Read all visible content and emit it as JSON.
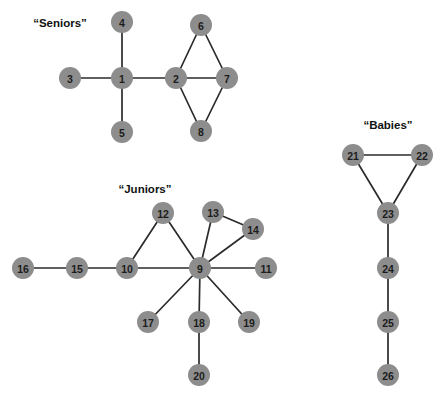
{
  "figure": {
    "background_color": "#ffffff",
    "node_color": "#8d8d8d",
    "edge_color": "#2b2b2b",
    "label_color": "#1c1c1c",
    "node_radius": 11
  },
  "cluster_labels": [
    {
      "text": "“Seniors”",
      "x": 60,
      "y": 23
    },
    {
      "text": "“Juniors”",
      "x": 145,
      "y": 189
    },
    {
      "text": "“Babies”",
      "x": 388,
      "y": 125
    }
  ],
  "nodes": [
    {
      "id": "1",
      "label": "1",
      "x": 122,
      "y": 78,
      "cluster": "Seniors"
    },
    {
      "id": "2",
      "label": "2",
      "x": 176,
      "y": 78,
      "cluster": "Seniors"
    },
    {
      "id": "3",
      "label": "3",
      "x": 70,
      "y": 78,
      "cluster": "Seniors"
    },
    {
      "id": "4",
      "label": "4",
      "x": 122,
      "y": 22,
      "cluster": "Seniors"
    },
    {
      "id": "5",
      "label": "5",
      "x": 122,
      "y": 132,
      "cluster": "Seniors"
    },
    {
      "id": "6",
      "label": "6",
      "x": 201,
      "y": 25,
      "cluster": "Seniors"
    },
    {
      "id": "7",
      "label": "7",
      "x": 227,
      "y": 78,
      "cluster": "Seniors"
    },
    {
      "id": "8",
      "label": "8",
      "x": 201,
      "y": 131,
      "cluster": "Seniors"
    },
    {
      "id": "9",
      "label": "9",
      "x": 200,
      "y": 268,
      "cluster": "Juniors"
    },
    {
      "id": "10",
      "label": "10",
      "x": 127,
      "y": 268,
      "cluster": "Juniors"
    },
    {
      "id": "11",
      "label": "11",
      "x": 266,
      "y": 268,
      "cluster": "Juniors"
    },
    {
      "id": "12",
      "label": "12",
      "x": 163,
      "y": 213,
      "cluster": "Juniors"
    },
    {
      "id": "13",
      "label": "13",
      "x": 213,
      "y": 212,
      "cluster": "Juniors"
    },
    {
      "id": "14",
      "label": "14",
      "x": 253,
      "y": 229,
      "cluster": "Juniors"
    },
    {
      "id": "15",
      "label": "15",
      "x": 77,
      "y": 268,
      "cluster": "Juniors"
    },
    {
      "id": "16",
      "label": "16",
      "x": 23,
      "y": 268,
      "cluster": "Juniors"
    },
    {
      "id": "17",
      "label": "17",
      "x": 148,
      "y": 322,
      "cluster": "Juniors"
    },
    {
      "id": "18",
      "label": "18",
      "x": 199,
      "y": 322,
      "cluster": "Juniors"
    },
    {
      "id": "19",
      "label": "19",
      "x": 249,
      "y": 322,
      "cluster": "Juniors"
    },
    {
      "id": "20",
      "label": "20",
      "x": 199,
      "y": 375,
      "cluster": "Juniors"
    },
    {
      "id": "21",
      "label": "21",
      "x": 353,
      "y": 155,
      "cluster": "Babies"
    },
    {
      "id": "22",
      "label": "22",
      "x": 422,
      "y": 155,
      "cluster": "Babies"
    },
    {
      "id": "23",
      "label": "23",
      "x": 388,
      "y": 213,
      "cluster": "Babies"
    },
    {
      "id": "24",
      "label": "24",
      "x": 388,
      "y": 268,
      "cluster": "Babies"
    },
    {
      "id": "25",
      "label": "25",
      "x": 388,
      "y": 322,
      "cluster": "Babies"
    },
    {
      "id": "26",
      "label": "26",
      "x": 388,
      "y": 375,
      "cluster": "Babies"
    }
  ],
  "edges": [
    {
      "source": "3",
      "target": "1"
    },
    {
      "source": "4",
      "target": "1"
    },
    {
      "source": "5",
      "target": "1"
    },
    {
      "source": "1",
      "target": "2"
    },
    {
      "source": "2",
      "target": "6"
    },
    {
      "source": "2",
      "target": "7"
    },
    {
      "source": "2",
      "target": "8"
    },
    {
      "source": "6",
      "target": "7"
    },
    {
      "source": "7",
      "target": "8"
    },
    {
      "source": "16",
      "target": "15"
    },
    {
      "source": "15",
      "target": "10"
    },
    {
      "source": "10",
      "target": "12"
    },
    {
      "source": "10",
      "target": "9"
    },
    {
      "source": "12",
      "target": "9"
    },
    {
      "source": "13",
      "target": "14"
    },
    {
      "source": "13",
      "target": "9"
    },
    {
      "source": "14",
      "target": "9"
    },
    {
      "source": "9",
      "target": "11"
    },
    {
      "source": "9",
      "target": "17"
    },
    {
      "source": "9",
      "target": "18"
    },
    {
      "source": "9",
      "target": "19"
    },
    {
      "source": "18",
      "target": "20"
    },
    {
      "source": "21",
      "target": "22"
    },
    {
      "source": "21",
      "target": "23"
    },
    {
      "source": "22",
      "target": "23"
    },
    {
      "source": "23",
      "target": "24"
    },
    {
      "source": "24",
      "target": "25"
    },
    {
      "source": "25",
      "target": "26"
    }
  ]
}
